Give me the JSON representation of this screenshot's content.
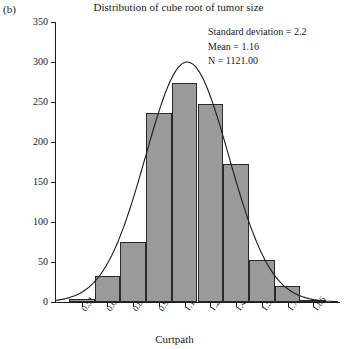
{
  "panel_label": "(b)",
  "chart_data": {
    "type": "bar",
    "title": "Distribution of cube root of tumor size",
    "xlabel": "Curtpath",
    "ylabel": "",
    "categories": [
      "0.51",
      "0.66",
      "0.81",
      "0.96",
      "1.11",
      "1.26",
      "1.41",
      "1.56",
      "1.71",
      "1.86"
    ],
    "xtick_labels": [
      "0.51",
      "0.66",
      "0.81",
      "0.96",
      "1.11",
      "1.26",
      "1.41",
      "1.56",
      "1.71",
      "1.86"
    ],
    "ytick_labels": [
      "0",
      "50",
      "100",
      "150",
      "200",
      "250",
      "300",
      "350"
    ],
    "ylim": [
      0,
      350
    ],
    "ytick_step": 50,
    "grid": false,
    "legend": "none",
    "bar_color": "#9a9a9a",
    "bar_edge_color": "#2a2a2a",
    "values": [
      4,
      33,
      75,
      236,
      274,
      248,
      172,
      52,
      20,
      3
    ],
    "overlay": {
      "type": "line",
      "name": "normal-curve",
      "peak_value": 300,
      "peak_x": 1.19,
      "color": "#1a1a1a"
    },
    "annotations": [
      "Standard deviation = 2.2",
      "Mean = 1.16",
      "N = 1121.00"
    ]
  },
  "stats": {
    "std": "Standard deviation = 2.2",
    "mean": "Mean = 1.16",
    "n": "N = 1121.00"
  }
}
